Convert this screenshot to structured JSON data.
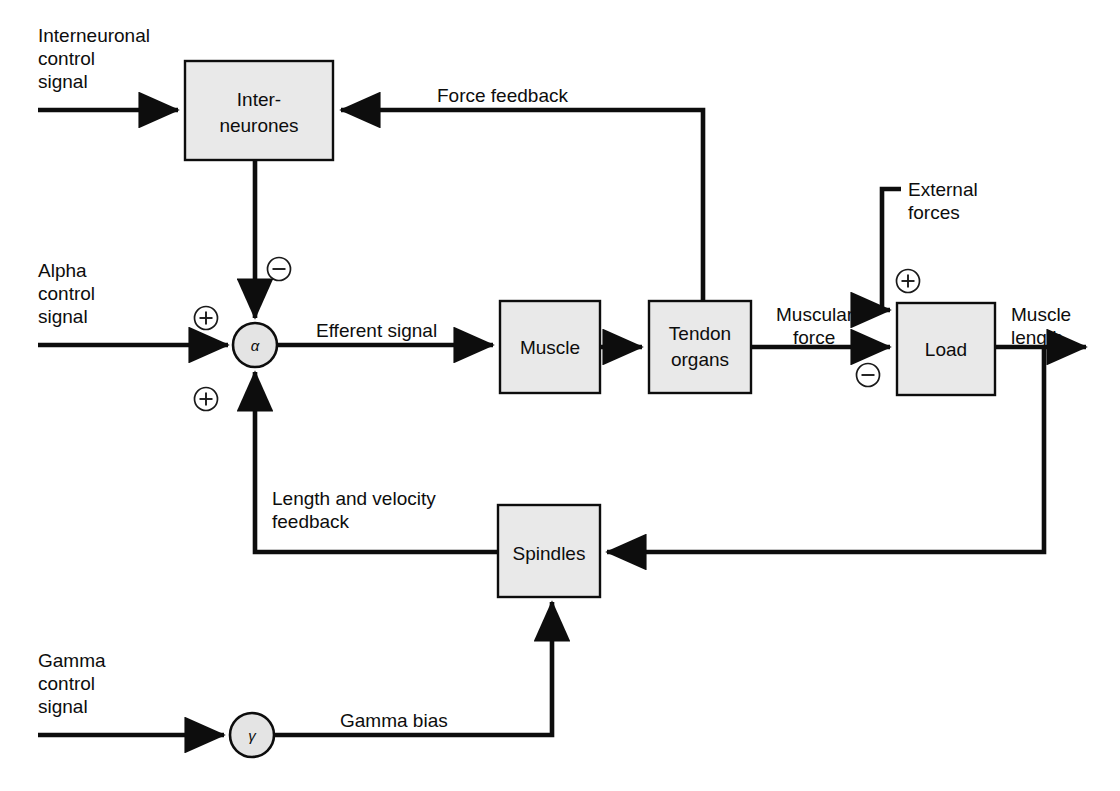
{
  "figure": {
    "type": "block-diagram",
    "background_color": "#ffffff",
    "line_color": "#0d0d0d",
    "box_fill_color": "#e9e9e9",
    "caption": ""
  },
  "blocks": [
    {
      "id": "interneurones",
      "label_line1": "Inter-",
      "label_line2": "neurones"
    },
    {
      "id": "muscle",
      "label_line1": "Muscle",
      "label_line2": ""
    },
    {
      "id": "tendon_organs",
      "label_line1": "Tendon",
      "label_line2": "organs"
    },
    {
      "id": "load",
      "label_line1": "Load",
      "label_line2": ""
    },
    {
      "id": "spindles",
      "label_line1": "Spindles",
      "label_line2": ""
    }
  ],
  "nodes": [
    {
      "id": "alpha",
      "label": "α"
    },
    {
      "id": "gamma",
      "label": "γ"
    }
  ],
  "inputs": [
    {
      "id": "interneuronal_control",
      "line1": "Interneuronal",
      "line2": "control",
      "line3": "signal"
    },
    {
      "id": "alpha_control",
      "line1": "Alpha",
      "line2": "control",
      "line3": "signal"
    },
    {
      "id": "gamma_control",
      "line1": "Gamma",
      "line2": "control",
      "line3": "signal"
    },
    {
      "id": "external_forces",
      "line1": "External",
      "line2": "forces",
      "line3": ""
    }
  ],
  "signals": [
    {
      "id": "force_feedback",
      "line1": "Force feedback",
      "line2": ""
    },
    {
      "id": "efferent_signal",
      "line1": "Efferent signal",
      "line2": ""
    },
    {
      "id": "muscular_force",
      "line1": "Muscular",
      "line2": "force"
    },
    {
      "id": "muscle_length",
      "line1": "Muscle",
      "line2": "length"
    },
    {
      "id": "length_velocity_feedback",
      "line1": "Length and velocity",
      "line2": "feedback"
    },
    {
      "id": "gamma_bias",
      "line1": "Gamma bias",
      "line2": ""
    }
  ],
  "signs": [
    {
      "id": "interneurone-to-alpha",
      "symbol": "−"
    },
    {
      "id": "alpha-control-to-alpha",
      "symbol": "+"
    },
    {
      "id": "spindle-feedback-to-alpha",
      "symbol": "+"
    },
    {
      "id": "external-forces-to-load",
      "symbol": "+"
    },
    {
      "id": "muscular-force-to-load",
      "symbol": "−"
    }
  ]
}
